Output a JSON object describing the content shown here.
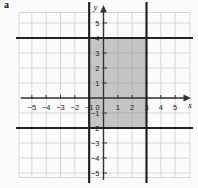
{
  "figure_label": "a",
  "colors": {
    "background": "#fcfcfc",
    "grid_line": "#d6d6d6",
    "axis_line": "#333333",
    "bold_line": "#222222",
    "region_fill": "#828282",
    "text": "#222222"
  },
  "chart_data": {
    "type": "region-plot",
    "title": "",
    "xlabel": "x",
    "ylabel": "y",
    "xlim": [
      -6,
      6
    ],
    "ylim": [
      -6,
      6
    ],
    "grid": true,
    "x_ticks": [
      -5,
      -4,
      -3,
      -2,
      -1,
      0,
      1,
      2,
      3,
      4,
      5
    ],
    "y_ticks": [
      5,
      4,
      3,
      2,
      1,
      -1,
      -2,
      -3,
      -4,
      -5
    ],
    "boundary_lines": [
      {
        "orientation": "vertical",
        "value": -1
      },
      {
        "orientation": "vertical",
        "value": 3
      },
      {
        "orientation": "horizontal",
        "value": 4
      },
      {
        "orientation": "horizontal",
        "value": -2
      }
    ],
    "shaded_region": {
      "x_min": -1,
      "x_max": 3,
      "y_min": -2,
      "y_max": 4
    }
  }
}
